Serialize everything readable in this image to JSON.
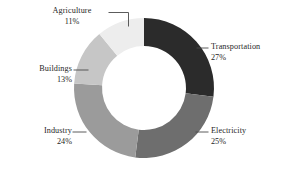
{
  "chart_data": {
    "type": "pie",
    "variant": "donut",
    "title": "",
    "subtitle": "",
    "xlabel": "",
    "ylabel": "",
    "grid": false,
    "legend_position": "callout-labels",
    "value_unit": "percent",
    "start_angle_deg": 0,
    "direction": "clockwise",
    "categories": [
      "Transportation",
      "Electricity",
      "Industry",
      "Buildings",
      "Agriculture"
    ],
    "values": [
      27,
      25,
      24,
      13,
      11
    ],
    "labels": [
      "27%",
      "25%",
      "24%",
      "13%",
      "11%"
    ],
    "colors": [
      "#2b2b2b",
      "#6e6e6e",
      "#9b9b9b",
      "#c6c6c6",
      "#ededed"
    ],
    "slices": [
      {
        "name": "Transportation",
        "value": 27,
        "label": "27%",
        "color": "#2b2b2b"
      },
      {
        "name": "Electricity",
        "value": 25,
        "label": "25%",
        "color": "#6e6e6e"
      },
      {
        "name": "Industry",
        "value": 24,
        "label": "24%",
        "color": "#9b9b9b"
      },
      {
        "name": "Buildings",
        "value": 13,
        "label": "13%",
        "color": "#c6c6c6"
      },
      {
        "name": "Agriculture",
        "value": 11,
        "label": "11%",
        "color": "#ededed"
      }
    ]
  },
  "callouts": {
    "agriculture": {
      "category": "Agriculture",
      "percent": "11%"
    },
    "transportation": {
      "category": "Transportation",
      "percent": "27%"
    },
    "electricity": {
      "category": "Electricity",
      "percent": "25%"
    },
    "industry": {
      "category": "Industry",
      "percent": "24%"
    },
    "buildings": {
      "category": "Buildings",
      "percent": "13%"
    }
  },
  "style": {
    "background": "#ffffff",
    "text_color": "#1f1f1f",
    "leader_line_color": "#4a4a4a"
  }
}
